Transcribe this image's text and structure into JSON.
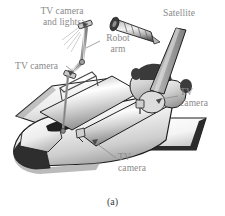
{
  "figure": {
    "caption": "(a)",
    "background_color": "#ffffff",
    "label_color": "#8a8a8a",
    "caption_color": "#3a3a3a"
  },
  "labels": {
    "camera_and_lights": "TV camera\nand lights",
    "camera_and_lights_line1": "TV camera",
    "camera_and_lights_line2": "and lights",
    "satellite": "Satellite",
    "robot_arm_line1": "Robot",
    "robot_arm_line2": "arm",
    "camera_left": "TV camera",
    "camera_right_line1": "TV",
    "camera_right_line2": "camera",
    "camera_bottom_line1": "TV",
    "camera_bottom_line2": "camera"
  },
  "parts": {
    "orbiter": "space-shuttle-orbiter",
    "payload_bay_doors": "payload-bay-doors",
    "vertical_stabilizer": "vertical-stabilizer",
    "engine_pods": "orbital-maneuvering-system-pods",
    "delta_wing_left": "left-delta-wing",
    "delta_wing_right": "right-delta-wing",
    "nose_cone": "nose-cone",
    "cockpit_window": "cockpit-window",
    "robot_arm": "remote-manipulator-arm",
    "satellite_body": "cylindrical-satellite"
  },
  "colors": {
    "outline": "#1d1d1d",
    "dark_edge": "#2b2b2b",
    "metal_light": "#f2f2f2",
    "metal_mid": "#b9b9b9",
    "metal_dark": "#6e6e6e",
    "shadow": "#8d8d8d"
  }
}
